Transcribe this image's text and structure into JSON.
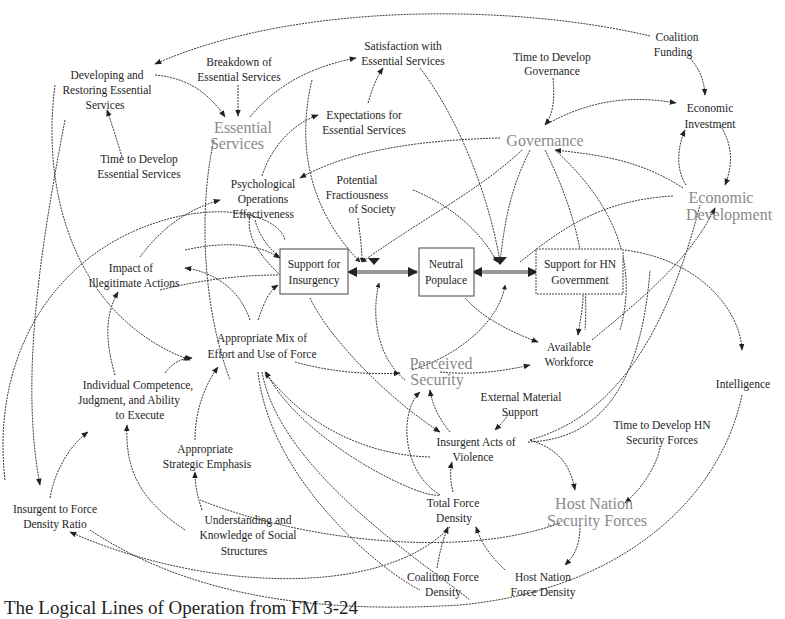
{
  "diagram": {
    "caption": "The Logical Lines of Operation from FM 3-24",
    "stocks": {
      "support_insurgency": [
        "Support for",
        "Insurgency"
      ],
      "neutral_populace": [
        "Neutral",
        "Populace"
      ],
      "support_hn_government": [
        "Support for HN",
        "Government"
      ]
    },
    "sectors": {
      "essential_services": [
        "Essential",
        "Services"
      ],
      "governance": [
        "Governance"
      ],
      "economic_development": [
        "Economic",
        "Development"
      ],
      "perceived_security": [
        "Perceived",
        "Security"
      ],
      "host_nation_security_forces": [
        "Host Nation",
        "Security Forces"
      ]
    },
    "variables": {
      "developing_restoring": [
        "Developing and",
        "Restoring Essential",
        "Services"
      ],
      "breakdown_services": [
        "Breakdown of",
        "Essential Services"
      ],
      "satisfaction_services": [
        "Satisfaction with",
        "Essential Services"
      ],
      "time_develop_governance": [
        "Time to Develop",
        "Governance"
      ],
      "coalition_funding": [
        "Coalition",
        "Funding"
      ],
      "economic_investment": [
        "Economic",
        "Investment"
      ],
      "expectations_services": [
        "Expectations for",
        "Essential Services"
      ],
      "time_develop_services": [
        "Time to Develop",
        "Essential Services"
      ],
      "psyops": [
        "Psychological",
        "Operations",
        "Effectiveness"
      ],
      "potential_fractiousness": [
        "Potential",
        "Fractiousness",
        "of Society"
      ],
      "impact_illegitimate": [
        "Impact of",
        "Illegitimate Actions"
      ],
      "appropriate_mix": [
        "Appropriate Mix of",
        "Effort and Use of Force"
      ],
      "available_workforce": [
        "Available",
        "Workforce"
      ],
      "intelligence": [
        "Intelligence"
      ],
      "individual_competence": [
        "Individual Competence,",
        "Judgment, and Ability",
        "to Execute"
      ],
      "external_material_support": [
        "External Material",
        "Support"
      ],
      "insurgent_acts_violence": [
        "Insurgent Acts of",
        "Violence"
      ],
      "time_develop_hn_forces": [
        "Time to Develop HN",
        "Security Forces"
      ],
      "appropriate_strategic_emphasis": [
        "Appropriate",
        "Strategic Emphasis"
      ],
      "insurgent_force_ratio": [
        "Insurgent to Force",
        "Density Ratio"
      ],
      "understanding_social": [
        "Understanding and",
        "Knowledge of Social",
        "Structures"
      ],
      "total_force_density": [
        "Total Force",
        "Density"
      ],
      "coalition_force_density": [
        "Coalition Force",
        "Density"
      ],
      "hn_force_density": [
        "Host Nation",
        "Force Density"
      ]
    },
    "colors": {
      "line": "#3a3a3a",
      "text": "#1e1e1e",
      "sector_text": "#8a8a8a",
      "background": "#ffffff"
    }
  }
}
